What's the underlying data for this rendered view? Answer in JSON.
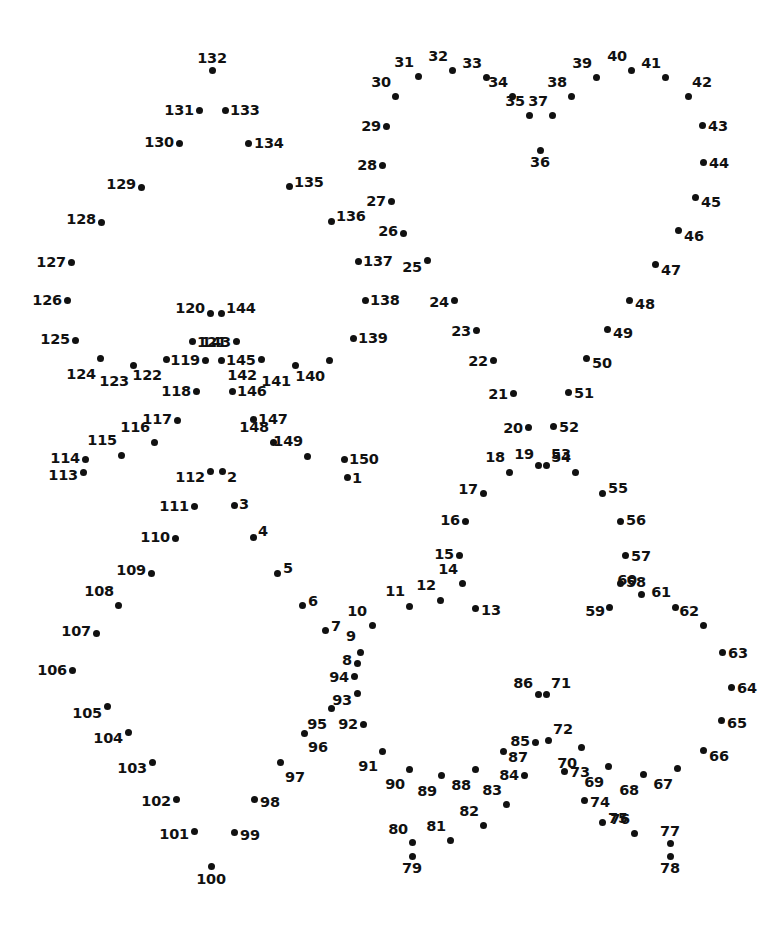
{
  "page": {
    "kind": "connect-the-dots-puzzle",
    "width": 784,
    "height": 929,
    "background_color": "#ffffff",
    "dot_color": "#111111",
    "label_color": "#111111",
    "dot_count": 150
  },
  "dots": [
    {
      "n": "1",
      "x": 347,
      "y": 477,
      "lx": 352,
      "ly": 478,
      "anchor": "lbl-r"
    },
    {
      "n": "2",
      "x": 222,
      "y": 471,
      "lx": 227,
      "ly": 477,
      "anchor": "lbl-r"
    },
    {
      "n": "3",
      "x": 234,
      "y": 505,
      "lx": 239,
      "ly": 504,
      "anchor": "lbl-r"
    },
    {
      "n": "4",
      "x": 253,
      "y": 537,
      "lx": 258,
      "ly": 531,
      "anchor": "lbl-r"
    },
    {
      "n": "5",
      "x": 277,
      "y": 573,
      "lx": 283,
      "ly": 568,
      "anchor": "lbl-r"
    },
    {
      "n": "6",
      "x": 302,
      "y": 605,
      "lx": 308,
      "ly": 601,
      "anchor": "lbl-r"
    },
    {
      "n": "7",
      "x": 325,
      "y": 630,
      "lx": 331,
      "ly": 626,
      "anchor": "lbl-r"
    },
    {
      "n": "8",
      "x": 357,
      "y": 663,
      "lx": 352,
      "ly": 660,
      "anchor": "lbl-l"
    },
    {
      "n": "9",
      "x": 360,
      "y": 652,
      "lx": 356,
      "ly": 643,
      "anchor": "lbl-tl"
    },
    {
      "n": "10",
      "x": 372,
      "y": 625,
      "lx": 367,
      "ly": 618,
      "anchor": "lbl-tl"
    },
    {
      "n": "11",
      "x": 409,
      "y": 606,
      "lx": 405,
      "ly": 598,
      "anchor": "lbl-tl"
    },
    {
      "n": "12",
      "x": 440,
      "y": 600,
      "lx": 436,
      "ly": 592,
      "anchor": "lbl-tl"
    },
    {
      "n": "13",
      "x": 475,
      "y": 608,
      "lx": 481,
      "ly": 610,
      "anchor": "lbl-r"
    },
    {
      "n": "14",
      "x": 462,
      "y": 583,
      "lx": 458,
      "ly": 576,
      "anchor": "lbl-tl"
    },
    {
      "n": "15",
      "x": 459,
      "y": 555,
      "lx": 454,
      "ly": 554,
      "anchor": "lbl-l"
    },
    {
      "n": "16",
      "x": 465,
      "y": 521,
      "lx": 460,
      "ly": 520,
      "anchor": "lbl-l"
    },
    {
      "n": "17",
      "x": 483,
      "y": 493,
      "lx": 478,
      "ly": 489,
      "anchor": "lbl-l"
    },
    {
      "n": "18",
      "x": 509,
      "y": 472,
      "lx": 505,
      "ly": 464,
      "anchor": "lbl-tl"
    },
    {
      "n": "19",
      "x": 538,
      "y": 465,
      "lx": 534,
      "ly": 461,
      "anchor": "lbl-tl"
    },
    {
      "n": "20",
      "x": 528,
      "y": 427,
      "lx": 523,
      "ly": 428,
      "anchor": "lbl-l"
    },
    {
      "n": "21",
      "x": 513,
      "y": 393,
      "lx": 508,
      "ly": 394,
      "anchor": "lbl-l"
    },
    {
      "n": "22",
      "x": 493,
      "y": 360,
      "lx": 488,
      "ly": 361,
      "anchor": "lbl-l"
    },
    {
      "n": "23",
      "x": 476,
      "y": 330,
      "lx": 471,
      "ly": 331,
      "anchor": "lbl-l"
    },
    {
      "n": "24",
      "x": 454,
      "y": 300,
      "lx": 449,
      "ly": 302,
      "anchor": "lbl-l"
    },
    {
      "n": "25",
      "x": 427,
      "y": 260,
      "lx": 422,
      "ly": 267,
      "anchor": "lbl-l"
    },
    {
      "n": "26",
      "x": 403,
      "y": 233,
      "lx": 398,
      "ly": 231,
      "anchor": "lbl-l"
    },
    {
      "n": "27",
      "x": 391,
      "y": 201,
      "lx": 386,
      "ly": 201,
      "anchor": "lbl-l"
    },
    {
      "n": "28",
      "x": 382,
      "y": 165,
      "lx": 377,
      "ly": 165,
      "anchor": "lbl-l"
    },
    {
      "n": "29",
      "x": 386,
      "y": 126,
      "lx": 381,
      "ly": 126,
      "anchor": "lbl-l"
    },
    {
      "n": "30",
      "x": 395,
      "y": 96,
      "lx": 391,
      "ly": 89,
      "anchor": "lbl-tl"
    },
    {
      "n": "31",
      "x": 418,
      "y": 76,
      "lx": 414,
      "ly": 69,
      "anchor": "lbl-tl"
    },
    {
      "n": "32",
      "x": 452,
      "y": 70,
      "lx": 448,
      "ly": 63,
      "anchor": "lbl-tl"
    },
    {
      "n": "33",
      "x": 486,
      "y": 77,
      "lx": 482,
      "ly": 70,
      "anchor": "lbl-tl"
    },
    {
      "n": "34",
      "x": 512,
      "y": 96,
      "lx": 508,
      "ly": 89,
      "anchor": "lbl-tl"
    },
    {
      "n": "35",
      "x": 529,
      "y": 115,
      "lx": 525,
      "ly": 108,
      "anchor": "lbl-tl"
    },
    {
      "n": "36",
      "x": 540,
      "y": 150,
      "lx": 540,
      "ly": 155,
      "anchor": "lbl-b"
    },
    {
      "n": "37",
      "x": 552,
      "y": 115,
      "lx": 548,
      "ly": 108,
      "anchor": "lbl-tl"
    },
    {
      "n": "38",
      "x": 571,
      "y": 96,
      "lx": 567,
      "ly": 89,
      "anchor": "lbl-tl"
    },
    {
      "n": "39",
      "x": 596,
      "y": 77,
      "lx": 592,
      "ly": 70,
      "anchor": "lbl-tl"
    },
    {
      "n": "40",
      "x": 631,
      "y": 70,
      "lx": 627,
      "ly": 63,
      "anchor": "lbl-tl"
    },
    {
      "n": "41",
      "x": 665,
      "y": 77,
      "lx": 661,
      "ly": 70,
      "anchor": "lbl-tl"
    },
    {
      "n": "42",
      "x": 688,
      "y": 96,
      "lx": 692,
      "ly": 89,
      "anchor": "lbl-tr"
    },
    {
      "n": "43",
      "x": 702,
      "y": 125,
      "lx": 708,
      "ly": 126,
      "anchor": "lbl-r"
    },
    {
      "n": "44",
      "x": 703,
      "y": 162,
      "lx": 709,
      "ly": 163,
      "anchor": "lbl-r"
    },
    {
      "n": "45",
      "x": 695,
      "y": 197,
      "lx": 701,
      "ly": 202,
      "anchor": "lbl-r"
    },
    {
      "n": "46",
      "x": 678,
      "y": 230,
      "lx": 684,
      "ly": 236,
      "anchor": "lbl-r"
    },
    {
      "n": "47",
      "x": 655,
      "y": 264,
      "lx": 661,
      "ly": 270,
      "anchor": "lbl-r"
    },
    {
      "n": "48",
      "x": 629,
      "y": 300,
      "lx": 635,
      "ly": 304,
      "anchor": "lbl-r"
    },
    {
      "n": "49",
      "x": 607,
      "y": 329,
      "lx": 613,
      "ly": 333,
      "anchor": "lbl-r"
    },
    {
      "n": "50",
      "x": 586,
      "y": 358,
      "lx": 592,
      "ly": 363,
      "anchor": "lbl-r"
    },
    {
      "n": "51",
      "x": 568,
      "y": 392,
      "lx": 574,
      "ly": 393,
      "anchor": "lbl-r"
    },
    {
      "n": "52",
      "x": 553,
      "y": 426,
      "lx": 559,
      "ly": 427,
      "anchor": "lbl-r"
    },
    {
      "n": "53",
      "x": 546,
      "y": 465,
      "lx": 551,
      "ly": 461,
      "anchor": "lbl-tr"
    },
    {
      "n": "54",
      "x": 575,
      "y": 472,
      "lx": 571,
      "ly": 464,
      "anchor": "lbl-tl"
    },
    {
      "n": "55",
      "x": 602,
      "y": 493,
      "lx": 608,
      "ly": 488,
      "anchor": "lbl-r"
    },
    {
      "n": "56",
      "x": 620,
      "y": 521,
      "lx": 626,
      "ly": 520,
      "anchor": "lbl-r"
    },
    {
      "n": "57",
      "x": 625,
      "y": 555,
      "lx": 631,
      "ly": 556,
      "anchor": "lbl-r"
    },
    {
      "n": "58",
      "x": 620,
      "y": 583,
      "lx": 626,
      "ly": 582,
      "anchor": "lbl-r"
    },
    {
      "n": "59",
      "x": 609,
      "y": 607,
      "lx": 605,
      "ly": 611,
      "anchor": "lbl-l"
    },
    {
      "n": "60",
      "x": 641,
      "y": 594,
      "lx": 637,
      "ly": 587,
      "anchor": "lbl-tl"
    },
    {
      "n": "61",
      "x": 675,
      "y": 607,
      "lx": 671,
      "ly": 599,
      "anchor": "lbl-tl"
    },
    {
      "n": "62",
      "x": 703,
      "y": 625,
      "lx": 699,
      "ly": 618,
      "anchor": "lbl-tl"
    },
    {
      "n": "63",
      "x": 722,
      "y": 652,
      "lx": 728,
      "ly": 653,
      "anchor": "lbl-r"
    },
    {
      "n": "64",
      "x": 731,
      "y": 687,
      "lx": 737,
      "ly": 688,
      "anchor": "lbl-r"
    },
    {
      "n": "65",
      "x": 721,
      "y": 720,
      "lx": 727,
      "ly": 723,
      "anchor": "lbl-r"
    },
    {
      "n": "66",
      "x": 703,
      "y": 750,
      "lx": 709,
      "ly": 756,
      "anchor": "lbl-r"
    },
    {
      "n": "67",
      "x": 677,
      "y": 768,
      "lx": 673,
      "ly": 777,
      "anchor": "lbl-bl"
    },
    {
      "n": "68",
      "x": 643,
      "y": 774,
      "lx": 639,
      "ly": 783,
      "anchor": "lbl-bl"
    },
    {
      "n": "69",
      "x": 608,
      "y": 766,
      "lx": 604,
      "ly": 775,
      "anchor": "lbl-bl"
    },
    {
      "n": "70",
      "x": 581,
      "y": 747,
      "lx": 577,
      "ly": 756,
      "anchor": "lbl-bl"
    },
    {
      "n": "71",
      "x": 546,
      "y": 694,
      "lx": 551,
      "ly": 690,
      "anchor": "lbl-tr"
    },
    {
      "n": "72",
      "x": 548,
      "y": 740,
      "lx": 553,
      "ly": 736,
      "anchor": "lbl-tr"
    },
    {
      "n": "73",
      "x": 564,
      "y": 771,
      "lx": 570,
      "ly": 772,
      "anchor": "lbl-r"
    },
    {
      "n": "74",
      "x": 584,
      "y": 800,
      "lx": 590,
      "ly": 802,
      "anchor": "lbl-r"
    },
    {
      "n": "75",
      "x": 602,
      "y": 822,
      "lx": 608,
      "ly": 818,
      "anchor": "lbl-r"
    },
    {
      "n": "76",
      "x": 634,
      "y": 833,
      "lx": 630,
      "ly": 826,
      "anchor": "lbl-tl"
    },
    {
      "n": "77",
      "x": 670,
      "y": 843,
      "lx": 670,
      "ly": 838,
      "anchor": "lbl-t"
    },
    {
      "n": "78",
      "x": 670,
      "y": 856,
      "lx": 670,
      "ly": 861,
      "anchor": "lbl-b"
    },
    {
      "n": "79",
      "x": 412,
      "y": 856,
      "lx": 412,
      "ly": 861,
      "anchor": "lbl-b"
    },
    {
      "n": "80",
      "x": 412,
      "y": 842,
      "lx": 408,
      "ly": 836,
      "anchor": "lbl-tl"
    },
    {
      "n": "81",
      "x": 450,
      "y": 840,
      "lx": 446,
      "ly": 833,
      "anchor": "lbl-tl"
    },
    {
      "n": "82",
      "x": 483,
      "y": 825,
      "lx": 479,
      "ly": 818,
      "anchor": "lbl-tl"
    },
    {
      "n": "83",
      "x": 506,
      "y": 804,
      "lx": 502,
      "ly": 797,
      "anchor": "lbl-tl"
    },
    {
      "n": "84",
      "x": 524,
      "y": 775,
      "lx": 519,
      "ly": 775,
      "anchor": "lbl-l"
    },
    {
      "n": "85",
      "x": 535,
      "y": 742,
      "lx": 530,
      "ly": 741,
      "anchor": "lbl-l"
    },
    {
      "n": "86",
      "x": 538,
      "y": 694,
      "lx": 533,
      "ly": 690,
      "anchor": "lbl-tl"
    },
    {
      "n": "87",
      "x": 503,
      "y": 751,
      "lx": 508,
      "ly": 757,
      "anchor": "lbl-r"
    },
    {
      "n": "88",
      "x": 475,
      "y": 769,
      "lx": 471,
      "ly": 778,
      "anchor": "lbl-bl"
    },
    {
      "n": "89",
      "x": 441,
      "y": 775,
      "lx": 437,
      "ly": 784,
      "anchor": "lbl-bl"
    },
    {
      "n": "90",
      "x": 409,
      "y": 769,
      "lx": 405,
      "ly": 777,
      "anchor": "lbl-bl"
    },
    {
      "n": "91",
      "x": 382,
      "y": 751,
      "lx": 378,
      "ly": 759,
      "anchor": "lbl-bl"
    },
    {
      "n": "92",
      "x": 363,
      "y": 724,
      "lx": 358,
      "ly": 724,
      "anchor": "lbl-l"
    },
    {
      "n": "93",
      "x": 357,
      "y": 693,
      "lx": 352,
      "ly": 700,
      "anchor": "lbl-l"
    },
    {
      "n": "94",
      "x": 354,
      "y": 676,
      "lx": 349,
      "ly": 677,
      "anchor": "lbl-l"
    },
    {
      "n": "95",
      "x": 331,
      "y": 708,
      "lx": 327,
      "ly": 717,
      "anchor": "lbl-bl"
    },
    {
      "n": "96",
      "x": 304,
      "y": 733,
      "lx": 308,
      "ly": 740,
      "anchor": "lbl-br"
    },
    {
      "n": "97",
      "x": 280,
      "y": 762,
      "lx": 285,
      "ly": 770,
      "anchor": "lbl-br"
    },
    {
      "n": "98",
      "x": 254,
      "y": 799,
      "lx": 260,
      "ly": 802,
      "anchor": "lbl-r"
    },
    {
      "n": "99",
      "x": 234,
      "y": 832,
      "lx": 240,
      "ly": 835,
      "anchor": "lbl-r"
    },
    {
      "n": "100",
      "x": 211,
      "y": 866,
      "lx": 211,
      "ly": 872,
      "anchor": "lbl-b"
    },
    {
      "n": "101",
      "x": 194,
      "y": 831,
      "lx": 189,
      "ly": 834,
      "anchor": "lbl-l"
    },
    {
      "n": "102",
      "x": 176,
      "y": 799,
      "lx": 171,
      "ly": 801,
      "anchor": "lbl-l"
    },
    {
      "n": "103",
      "x": 152,
      "y": 762,
      "lx": 147,
      "ly": 768,
      "anchor": "lbl-l"
    },
    {
      "n": "104",
      "x": 128,
      "y": 732,
      "lx": 123,
      "ly": 738,
      "anchor": "lbl-l"
    },
    {
      "n": "105",
      "x": 107,
      "y": 706,
      "lx": 102,
      "ly": 713,
      "anchor": "lbl-l"
    },
    {
      "n": "106",
      "x": 72,
      "y": 670,
      "lx": 67,
      "ly": 670,
      "anchor": "lbl-l"
    },
    {
      "n": "107",
      "x": 96,
      "y": 633,
      "lx": 91,
      "ly": 631,
      "anchor": "lbl-l"
    },
    {
      "n": "108",
      "x": 118,
      "y": 605,
      "lx": 114,
      "ly": 598,
      "anchor": "lbl-tl"
    },
    {
      "n": "109",
      "x": 151,
      "y": 573,
      "lx": 146,
      "ly": 570,
      "anchor": "lbl-l"
    },
    {
      "n": "110",
      "x": 175,
      "y": 538,
      "lx": 170,
      "ly": 537,
      "anchor": "lbl-l"
    },
    {
      "n": "111",
      "x": 194,
      "y": 506,
      "lx": 189,
      "ly": 506,
      "anchor": "lbl-l"
    },
    {
      "n": "112",
      "x": 210,
      "y": 471,
      "lx": 205,
      "ly": 477,
      "anchor": "lbl-l"
    },
    {
      "n": "113",
      "x": 83,
      "y": 472,
      "lx": 78,
      "ly": 475,
      "anchor": "lbl-l"
    },
    {
      "n": "114",
      "x": 85,
      "y": 459,
      "lx": 80,
      "ly": 458,
      "anchor": "lbl-l"
    },
    {
      "n": "115",
      "x": 121,
      "y": 455,
      "lx": 117,
      "ly": 447,
      "anchor": "lbl-tl"
    },
    {
      "n": "116",
      "x": 154,
      "y": 442,
      "lx": 150,
      "ly": 434,
      "anchor": "lbl-tl"
    },
    {
      "n": "117",
      "x": 177,
      "y": 420,
      "lx": 172,
      "ly": 419,
      "anchor": "lbl-l"
    },
    {
      "n": "118",
      "x": 196,
      "y": 391,
      "lx": 191,
      "ly": 391,
      "anchor": "lbl-l"
    },
    {
      "n": "119",
      "x": 205,
      "y": 360,
      "lx": 200,
      "ly": 360,
      "anchor": "lbl-l"
    },
    {
      "n": "120",
      "x": 210,
      "y": 313,
      "lx": 205,
      "ly": 308,
      "anchor": "lbl-l"
    },
    {
      "n": "121",
      "x": 192,
      "y": 341,
      "lx": 197,
      "ly": 342,
      "anchor": "lbl-r"
    },
    {
      "n": "122",
      "x": 166,
      "y": 359,
      "lx": 162,
      "ly": 368,
      "anchor": "lbl-bl"
    },
    {
      "n": "123",
      "x": 133,
      "y": 365,
      "lx": 129,
      "ly": 374,
      "anchor": "lbl-bl"
    },
    {
      "n": "124",
      "x": 100,
      "y": 358,
      "lx": 96,
      "ly": 367,
      "anchor": "lbl-bl"
    },
    {
      "n": "125",
      "x": 75,
      "y": 340,
      "lx": 70,
      "ly": 339,
      "anchor": "lbl-l"
    },
    {
      "n": "126",
      "x": 67,
      "y": 300,
      "lx": 62,
      "ly": 300,
      "anchor": "lbl-l"
    },
    {
      "n": "127",
      "x": 71,
      "y": 262,
      "lx": 66,
      "ly": 262,
      "anchor": "lbl-l"
    },
    {
      "n": "128",
      "x": 101,
      "y": 222,
      "lx": 96,
      "ly": 219,
      "anchor": "lbl-l"
    },
    {
      "n": "129",
      "x": 141,
      "y": 187,
      "lx": 136,
      "ly": 184,
      "anchor": "lbl-l"
    },
    {
      "n": "130",
      "x": 179,
      "y": 143,
      "lx": 174,
      "ly": 142,
      "anchor": "lbl-l"
    },
    {
      "n": "131",
      "x": 199,
      "y": 110,
      "lx": 194,
      "ly": 110,
      "anchor": "lbl-l"
    },
    {
      "n": "132",
      "x": 212,
      "y": 70,
      "lx": 212,
      "ly": 65,
      "anchor": "lbl-t"
    },
    {
      "n": "133",
      "x": 225,
      "y": 110,
      "lx": 230,
      "ly": 110,
      "anchor": "lbl-r"
    },
    {
      "n": "134",
      "x": 248,
      "y": 143,
      "lx": 254,
      "ly": 143,
      "anchor": "lbl-r"
    },
    {
      "n": "135",
      "x": 289,
      "y": 186,
      "lx": 294,
      "ly": 182,
      "anchor": "lbl-r"
    },
    {
      "n": "136",
      "x": 331,
      "y": 221,
      "lx": 336,
      "ly": 216,
      "anchor": "lbl-r"
    },
    {
      "n": "137",
      "x": 358,
      "y": 261,
      "lx": 363,
      "ly": 261,
      "anchor": "lbl-r"
    },
    {
      "n": "138",
      "x": 365,
      "y": 300,
      "lx": 370,
      "ly": 300,
      "anchor": "lbl-r"
    },
    {
      "n": "139",
      "x": 353,
      "y": 338,
      "lx": 358,
      "ly": 338,
      "anchor": "lbl-r"
    },
    {
      "n": "140",
      "x": 329,
      "y": 360,
      "lx": 325,
      "ly": 369,
      "anchor": "lbl-bl"
    },
    {
      "n": "141",
      "x": 295,
      "y": 365,
      "lx": 291,
      "ly": 374,
      "anchor": "lbl-bl"
    },
    {
      "n": "142",
      "x": 261,
      "y": 359,
      "lx": 257,
      "ly": 368,
      "anchor": "lbl-bl"
    },
    {
      "n": "143",
      "x": 236,
      "y": 341,
      "lx": 231,
      "ly": 342,
      "anchor": "lbl-l"
    },
    {
      "n": "144",
      "x": 221,
      "y": 313,
      "lx": 226,
      "ly": 308,
      "anchor": "lbl-r"
    },
    {
      "n": "145",
      "x": 221,
      "y": 360,
      "lx": 226,
      "ly": 360,
      "anchor": "lbl-r"
    },
    {
      "n": "146",
      "x": 232,
      "y": 391,
      "lx": 237,
      "ly": 391,
      "anchor": "lbl-r"
    },
    {
      "n": "147",
      "x": 253,
      "y": 419,
      "lx": 258,
      "ly": 419,
      "anchor": "lbl-r"
    },
    {
      "n": "148",
      "x": 273,
      "y": 442,
      "lx": 269,
      "ly": 434,
      "anchor": "lbl-tl"
    },
    {
      "n": "149",
      "x": 307,
      "y": 456,
      "lx": 303,
      "ly": 448,
      "anchor": "lbl-tl"
    },
    {
      "n": "150",
      "x": 344,
      "y": 459,
      "lx": 349,
      "ly": 459,
      "anchor": "lbl-r"
    }
  ]
}
